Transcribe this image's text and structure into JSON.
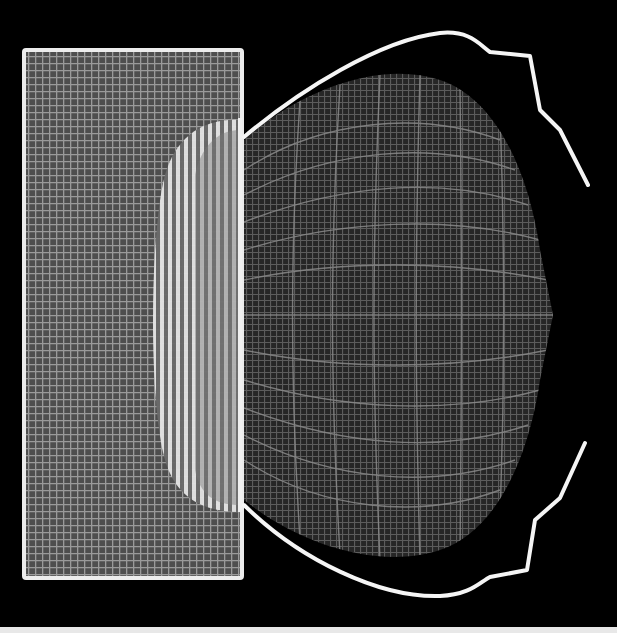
{
  "figure": {
    "background": "#000000",
    "block": {
      "x": 24,
      "y": 50,
      "width": 218,
      "height": 528,
      "outline_color": "#e6e6e6",
      "fill_color": "#5a5a5a",
      "grid_color": "#8c8c8c",
      "grid_spacing": 7
    },
    "bright_region": {
      "color": "#f2f2f2",
      "stripe_color": "#9a9a9a"
    },
    "deformed_mesh": {
      "fill_color": "#2e2e2e",
      "grid_color": "#7a7a7a",
      "apex": [
        553,
        315
      ]
    },
    "contour": {
      "color": "#f5f5f5",
      "stroke_width": 4
    }
  }
}
